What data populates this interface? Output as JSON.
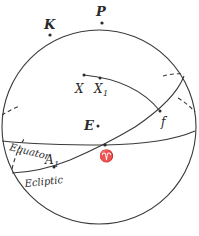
{
  "figure": {
    "colors": {
      "line": "#3a3a3a",
      "background": "#ffffff"
    },
    "points": {
      "P": {
        "label": "P"
      },
      "K": {
        "label": "K"
      },
      "X": {
        "label": "X"
      },
      "X1": {
        "label": "X",
        "sub": "1"
      },
      "E": {
        "label": "E"
      },
      "aries": {
        "label": "♈"
      },
      "f": {
        "label": "f"
      },
      "A1": {
        "label": "A",
        "sub": "1"
      }
    },
    "circles": {
      "equator": {
        "label": "Equator"
      },
      "ecliptic": {
        "label": "Ecliptic"
      }
    }
  }
}
